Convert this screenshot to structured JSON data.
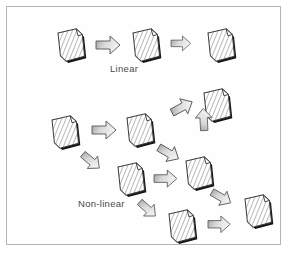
{
  "figure": {
    "title": "",
    "background_color": "#ffffff",
    "border_color": "#b4b4b4",
    "document_icon_name": "document-page-icon",
    "arrow_icon_name": "block-arrow-icon"
  },
  "labels": {
    "linear": "Linear",
    "nonlinear": "Non-linear"
  },
  "colors": {
    "paper_fill": "#ffffff",
    "paper_outline": "#3a3a3a",
    "paper_hatch": "#9a9a9a",
    "paper_shadow": "#151515",
    "arrow_outline": "#555555",
    "arrow_fill_dark": "#9d9d9d",
    "arrow_fill_light": "#f2f2f2",
    "text": "#4a4a4a"
  },
  "diagram_data": {
    "type": "diagram",
    "description": "Two flow diagrams contrasting linear and non-linear document navigation structures.",
    "groups": [
      {
        "id": "linear",
        "label": "Linear",
        "label_x": 110,
        "label_y": 63,
        "nodes": [
          {
            "id": "L1",
            "type": "document",
            "x": 58,
            "y": 33,
            "rotate": -6
          },
          {
            "id": "L2",
            "type": "document",
            "x": 133,
            "y": 33,
            "rotate": -6
          },
          {
            "id": "L3",
            "type": "document",
            "x": 208,
            "y": 33,
            "rotate": -6
          }
        ],
        "edges": [
          {
            "from": "L1",
            "to": "L2",
            "x": 96,
            "y": 36,
            "angle": 0,
            "scale": 1.0
          },
          {
            "from": "L2",
            "to": "L3",
            "x": 171,
            "y": 36,
            "angle": 0,
            "scale": 0.82
          }
        ]
      },
      {
        "id": "nonlinear",
        "label": "Non-linear",
        "label_x": 78,
        "label_y": 198,
        "nodes": [
          {
            "id": "N1",
            "type": "document",
            "x": 52,
            "y": 120,
            "rotate": -6
          },
          {
            "id": "N2",
            "type": "document",
            "x": 127,
            "y": 118,
            "rotate": -6
          },
          {
            "id": "N3",
            "type": "document",
            "x": 204,
            "y": 93,
            "rotate": -6
          },
          {
            "id": "N4",
            "type": "document",
            "x": 118,
            "y": 167,
            "rotate": -6
          },
          {
            "id": "N5",
            "type": "document",
            "x": 186,
            "y": 161,
            "rotate": -6
          },
          {
            "id": "N6",
            "type": "document",
            "x": 169,
            "y": 214,
            "rotate": -6
          },
          {
            "id": "N7",
            "type": "document",
            "x": 245,
            "y": 199,
            "rotate": -6
          }
        ],
        "edges": [
          {
            "from": "N1",
            "to": "N2",
            "x": 92,
            "y": 121,
            "angle": 0,
            "scale": 1.0
          },
          {
            "from": "N2",
            "to": "N3",
            "x": 168,
            "y": 105,
            "angle": -28,
            "scale": 0.95
          },
          {
            "from": "N2",
            "to": "N5",
            "x": 163,
            "y": 140,
            "angle": 30,
            "scale": 0.95
          },
          {
            "from": "N1",
            "to": "N4",
            "x": 88,
            "y": 148,
            "angle": 40,
            "scale": 0.9
          },
          {
            "from": "N4",
            "to": "N5",
            "x": 154,
            "y": 170,
            "angle": 0,
            "scale": 0.95
          },
          {
            "from": "N5",
            "to": "N3",
            "x": 196,
            "y": 131,
            "angle": -93,
            "scale": 0.92
          },
          {
            "from": "N5",
            "to": "N7",
            "x": 216,
            "y": 185,
            "angle": 30,
            "scale": 0.9
          },
          {
            "from": "N4",
            "to": "N6",
            "x": 145,
            "y": 196,
            "angle": 42,
            "scale": 0.88
          },
          {
            "from": "N6",
            "to": "N7",
            "x": 208,
            "y": 216,
            "angle": 0,
            "scale": 0.92
          }
        ]
      }
    ]
  }
}
